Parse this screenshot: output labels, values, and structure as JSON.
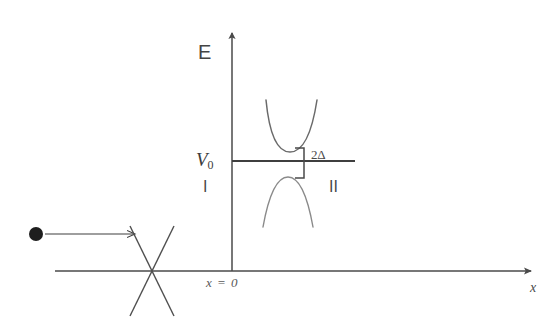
{
  "figure": {
    "width": 554,
    "height": 325,
    "background": "#ffffff",
    "ink_color": "#4a4a4a"
  },
  "axes": {
    "energy_axis_label": "E",
    "position_axis_label": "x",
    "origin_label": "x = 0",
    "energy_axis_x": 232,
    "energy_axis_top_y": 27,
    "position_axis_y": 271,
    "position_axis_left_x": 55,
    "position_axis_right_x": 537
  },
  "step": {
    "level_label": "V",
    "level_subscript": "0",
    "level_y": 161,
    "line_start_x": 232,
    "line_end_x": 355
  },
  "regions": {
    "left_label": "I",
    "right_label": "II"
  },
  "gap": {
    "label": "2Δ",
    "bracket_x": 303,
    "bracket_top_y": 148,
    "bracket_bottom_y": 178
  },
  "bands": {
    "conduction": {
      "name": "upper-parabola",
      "vertex_x": 290,
      "vertex_y": 152,
      "left_top_x": 266,
      "left_top_y": 100,
      "right_top_x": 317,
      "right_top_y": 100
    },
    "valence": {
      "name": "lower-parabola",
      "vertex_x": 288,
      "vertex_y": 177,
      "left_bottom_x": 263,
      "left_bottom_y": 227,
      "right_bottom_x": 313,
      "right_bottom_y": 227
    }
  },
  "incident": {
    "particle_name": "incident-particle",
    "particle_cx": 36,
    "particle_cy": 234,
    "particle_r": 7,
    "arrow_start_x": 44,
    "arrow_end_x": 140,
    "arrow_y": 234
  },
  "dirac_cone": {
    "name": "dirac-cone-crossing",
    "center_x": 152,
    "center_y": 271,
    "half_width": 22,
    "half_height": 45
  }
}
